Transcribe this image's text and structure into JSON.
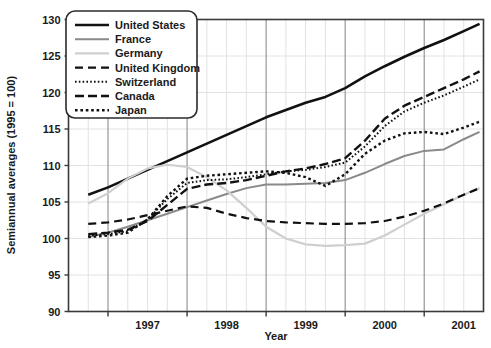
{
  "chart_data": {
    "type": "line",
    "title": "",
    "xlabel": "Year",
    "ylabel": "Semiannual averages (1995 = 100)",
    "ylim": [
      90,
      130
    ],
    "xlim": [
      1996.5,
      2001.75
    ],
    "yticks": [
      90,
      95,
      100,
      105,
      110,
      115,
      120,
      125,
      130
    ],
    "xticks": [
      1997,
      1998,
      1999,
      2000,
      2001
    ],
    "xtick_labels": [
      "1997",
      "1998",
      "1999",
      "2000",
      "2001"
    ],
    "ytick_labels": [
      "90",
      "95",
      "100",
      "105",
      "110",
      "115",
      "120",
      "125",
      "130"
    ],
    "grid": true,
    "grid_minor": "quarterly",
    "legend_position": "top-left",
    "x": [
      1996.75,
      1997.0,
      1997.25,
      1997.5,
      1997.75,
      1998.0,
      1998.25,
      1998.5,
      1998.75,
      1999.0,
      1999.25,
      1999.5,
      1999.75,
      2000.0,
      2000.25,
      2000.5,
      2000.75,
      2001.0,
      2001.25,
      2001.5,
      2001.7
    ],
    "series": [
      {
        "name": "United States",
        "style": "solid",
        "color": "#111111",
        "width": 2.6,
        "values": [
          106.0,
          107.0,
          108.2,
          109.4,
          110.6,
          111.8,
          113.0,
          114.2,
          115.4,
          116.6,
          117.6,
          118.6,
          119.4,
          120.6,
          122.2,
          123.6,
          124.9,
          126.1,
          127.2,
          128.4,
          129.4
        ]
      },
      {
        "name": "France",
        "style": "solid",
        "color": "#8a8a8a",
        "width": 2.0,
        "values": [
          100.2,
          100.8,
          101.6,
          102.5,
          103.4,
          104.3,
          105.2,
          106.1,
          106.9,
          107.4,
          107.4,
          107.5,
          107.6,
          108.0,
          109.0,
          110.2,
          111.3,
          112.0,
          112.2,
          113.6,
          114.6
        ]
      },
      {
        "name": "Germany",
        "style": "solid",
        "color": "#cfcfcf",
        "width": 2.2,
        "values": [
          104.8,
          106.2,
          108.2,
          109.6,
          110.1,
          109.8,
          108.4,
          106.6,
          104.2,
          101.6,
          100.0,
          99.2,
          99.0,
          99.1,
          99.3,
          100.4,
          101.9,
          103.4,
          104.7,
          106.0,
          106.9
        ]
      },
      {
        "name": "United Kingdom",
        "style": "dashed",
        "color": "#111111",
        "width": 2.2,
        "values": [
          102.0,
          102.2,
          102.6,
          103.2,
          103.8,
          104.4,
          104.2,
          103.4,
          102.8,
          102.4,
          102.2,
          102.1,
          102.0,
          102.0,
          102.1,
          102.4,
          103.0,
          103.8,
          104.8,
          106.0,
          106.9
        ]
      },
      {
        "name": "Switzerland",
        "style": "dotted-fine",
        "color": "#111111",
        "width": 2.0,
        "values": [
          100.4,
          100.6,
          101.0,
          102.6,
          105.4,
          107.6,
          108.0,
          108.1,
          108.4,
          108.8,
          109.2,
          109.4,
          109.8,
          110.4,
          112.6,
          115.4,
          117.4,
          118.6,
          119.6,
          120.8,
          121.8
        ]
      },
      {
        "name": "Canada",
        "style": "dashed-long",
        "color": "#111111",
        "width": 2.4,
        "values": [
          100.6,
          100.8,
          101.2,
          102.4,
          104.6,
          106.8,
          107.4,
          107.6,
          108.0,
          108.6,
          109.2,
          109.6,
          110.2,
          111.0,
          113.4,
          116.4,
          118.2,
          119.4,
          120.6,
          121.8,
          122.9
        ]
      },
      {
        "name": "Japan",
        "style": "dotted-coarse",
        "color": "#111111",
        "width": 2.4,
        "values": [
          100.2,
          100.4,
          100.8,
          102.6,
          105.8,
          108.2,
          108.6,
          108.8,
          109.0,
          109.2,
          109.0,
          108.4,
          107.2,
          108.8,
          111.6,
          113.4,
          114.4,
          114.6,
          114.3,
          115.2,
          116.0
        ]
      }
    ]
  },
  "legend": {
    "items": [
      {
        "label": "United States"
      },
      {
        "label": "France"
      },
      {
        "label": "Germany"
      },
      {
        "label": "United Kingdom"
      },
      {
        "label": "Switzerland"
      },
      {
        "label": "Canada"
      },
      {
        "label": "Japan"
      }
    ]
  }
}
